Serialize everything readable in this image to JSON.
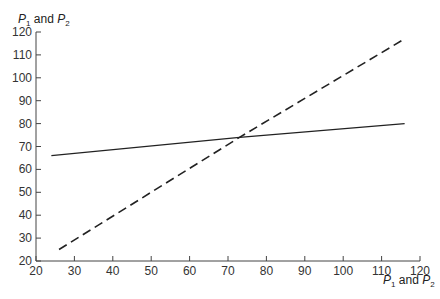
{
  "chart_data": {
    "type": "line",
    "title": "",
    "xlabel": "P1 and P2",
    "ylabel": "P1 and P2",
    "xlim": [
      20,
      120
    ],
    "ylim": [
      20,
      120
    ],
    "xticks": [
      20,
      30,
      40,
      50,
      60,
      70,
      80,
      90,
      100,
      110,
      120
    ],
    "yticks": [
      20,
      30,
      40,
      50,
      60,
      70,
      80,
      90,
      100,
      110,
      120
    ],
    "grid": false,
    "legend": null,
    "series": [
      {
        "name": "solid line",
        "style": "solid",
        "x": [
          24,
          73,
          116
        ],
        "y": [
          66,
          74,
          80
        ]
      },
      {
        "name": "dashed line",
        "style": "dashed",
        "x": [
          26,
          73,
          116
        ],
        "y": [
          25,
          74,
          117
        ]
      }
    ],
    "annotations": [
      {
        "text": "intersection",
        "x": 73,
        "y": 74
      }
    ]
  },
  "labels": {
    "y_axis_prefix": "P",
    "y_sub1": "1",
    "mid": " and P",
    "y_sub2": "2"
  }
}
